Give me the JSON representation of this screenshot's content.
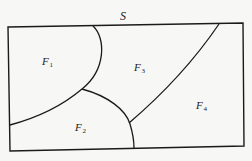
{
  "diagram": {
    "set_label": "S",
    "regions": [
      {
        "name": "F",
        "sub": "1"
      },
      {
        "name": "F",
        "sub": "2"
      },
      {
        "name": "F",
        "sub": "3"
      },
      {
        "name": "F",
        "sub": "4"
      }
    ],
    "colors": {
      "stroke": "#1a1a1a",
      "background": "#f7f7f5"
    }
  }
}
